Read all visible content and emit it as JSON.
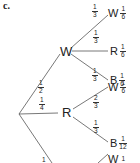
{
  "part_label": "c.",
  "root": {
    "branches": [
      {
        "prob": {
          "num": "1",
          "den": "2"
        },
        "node": "W",
        "children": [
          {
            "prob": {
              "num": "1",
              "den": "3"
            },
            "node": "W",
            "result": {
              "num": "1",
              "den": "6"
            }
          },
          {
            "prob": {
              "num": "1",
              "den": "3"
            },
            "node": "R",
            "result": {
              "num": "1",
              "den": "6"
            }
          },
          {
            "prob": {
              "num": "1",
              "den": "3"
            },
            "node": "B",
            "result": {
              "num": "1",
              "den": "6"
            }
          }
        ]
      },
      {
        "prob": {
          "num": "1",
          "den": "4"
        },
        "node": "R",
        "children": [
          {
            "prob": {
              "num": "2",
              "den": "3"
            },
            "node": "W",
            "result": {
              "num": "1",
              "den": "6"
            }
          },
          {
            "prob": {
              "num": "1",
              "den": "3"
            },
            "node": "B",
            "result": {
              "num": "1",
              "den": "12"
            }
          }
        ]
      },
      {
        "prob": {
          "num": "1",
          "den": ""
        },
        "node": "",
        "children": [
          {
            "prob": {
              "num": "",
              "den": ""
            },
            "node": "W",
            "result": {
              "num": "1",
              "den": ""
            }
          }
        ]
      }
    ]
  },
  "colors": {
    "line": "#555555",
    "text": "#222222",
    "background": "#ffffff"
  }
}
